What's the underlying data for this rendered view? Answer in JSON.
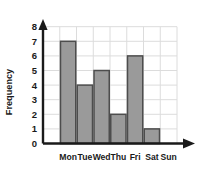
{
  "chart_data": {
    "type": "bar",
    "title": "",
    "xlabel": "",
    "ylabel": "Frequency",
    "categories": [
      "Mon",
      "Tue",
      "Wed",
      "Thu",
      "Fri",
      "Sat",
      "Sun"
    ],
    "values": [
      7,
      4,
      5,
      2,
      6,
      1,
      0
    ],
    "yticks": [
      "0",
      "1",
      "2",
      "3",
      "4",
      "5",
      "6",
      "7",
      "8"
    ],
    "ylim": [
      0,
      8
    ],
    "grid": "both",
    "legend": "none",
    "bar_fill_color": "#9a9a9a",
    "bar_stroke_color": "#4d4d4d",
    "grid_color": "#dcdcdc",
    "axis_color": "#1a1a1a",
    "background_color": "#ffffff"
  }
}
